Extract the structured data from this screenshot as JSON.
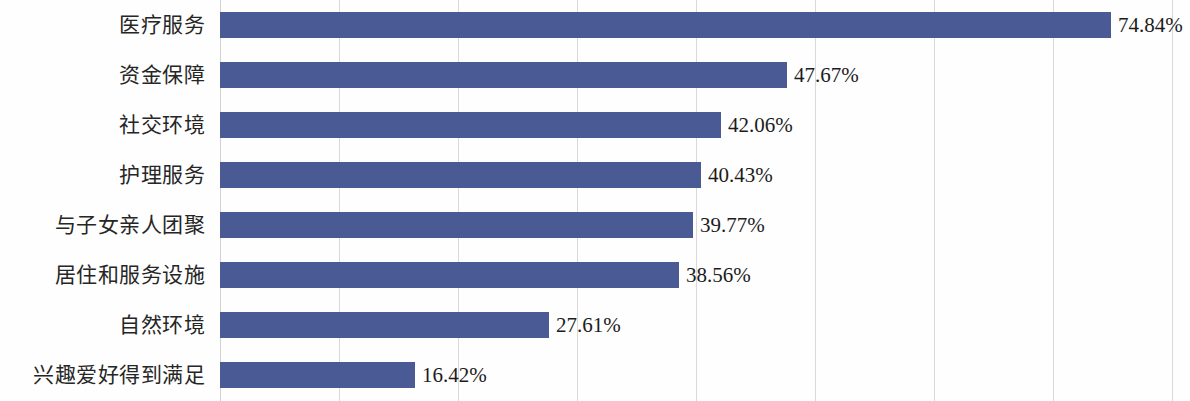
{
  "chart_data": {
    "type": "bar",
    "orientation": "horizontal",
    "title": "",
    "subtitle": "",
    "xlabel": "",
    "ylabel": "",
    "xlim": [
      0,
      80
    ],
    "grid": true,
    "grid_axis": "x",
    "grid_interval": 10,
    "legend": false,
    "legend_position": "none",
    "value_suffix": "%",
    "categories": [
      "医疗服务",
      "资金保障",
      "社交环境",
      "护理服务",
      "与子女亲人团聚",
      "居住和服务设施",
      "自然环境",
      "兴趣爱好得到满足"
    ],
    "values": [
      74.84,
      47.67,
      42.06,
      40.43,
      39.77,
      38.56,
      27.61,
      16.42
    ],
    "labels": [
      "74.84%",
      "47.67%",
      "42.06%",
      "40.43%",
      "39.77%",
      "38.56%",
      "27.61%",
      "16.42%"
    ],
    "series": [
      {
        "name": "",
        "values": [
          74.84,
          47.67,
          42.06,
          40.43,
          39.77,
          38.56,
          27.61,
          16.42
        ]
      }
    ],
    "gridline_values": [
      10,
      20,
      30,
      40,
      50,
      60,
      70,
      80
    ],
    "colors": {
      "bar": "#4a5a95",
      "gridline": "#d9d9d9",
      "axis": "#d2d2d2",
      "label_text": "#262626",
      "value_text": "#1c1c1c",
      "background": "#fefefe"
    }
  }
}
